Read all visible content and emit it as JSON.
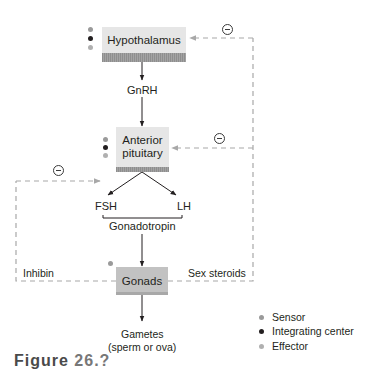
{
  "colors": {
    "sensor": "#9a9a9a",
    "integrating_center": "#231f20",
    "effector": "#b0b0b0",
    "box_fill": "#e6e6e6",
    "box_fill_dark": "#c2c2c2",
    "feedback_line": "#a8a8a8",
    "arrow": "#231f20"
  },
  "nodes": {
    "hypothalamus": {
      "label": "Hypothalamus"
    },
    "gnrh": {
      "label": "GnRH"
    },
    "anterior_pituitary": {
      "label_line1": "Anterior",
      "label_line2": "pituitary"
    },
    "fsh": {
      "label": "FSH"
    },
    "lh": {
      "label": "LH"
    },
    "gonadotropin": {
      "label": "Gonadotropin"
    },
    "gonads": {
      "label": "Gonads"
    },
    "gametes": {
      "label_line1": "Gametes",
      "label_line2": "(sperm or ova)"
    }
  },
  "feedback": {
    "inhibin": {
      "label": "Inhibin",
      "sign": "−"
    },
    "sex_steroids": {
      "label": "Sex steroids",
      "sign": "−"
    }
  },
  "legend": [
    {
      "label": "Sensor",
      "color_key": "sensor"
    },
    {
      "label": "Integrating center",
      "color_key": "integrating_center"
    },
    {
      "label": "Effector",
      "color_key": "effector"
    }
  ],
  "caption": {
    "prefix": "Figure",
    "number": "26.?"
  }
}
